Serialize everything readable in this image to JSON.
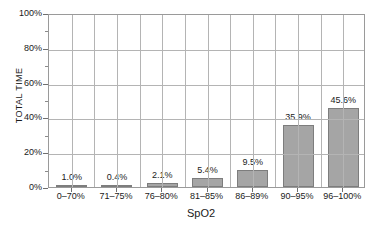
{
  "chart_data": {
    "type": "bar",
    "title": "",
    "xlabel": "SpO2",
    "ylabel": "TOTAL TIME",
    "categories": [
      "0–70%",
      "71–75%",
      "76–80%",
      "81–85%",
      "86–89%",
      "90–95%",
      "96–100%"
    ],
    "values": [
      1.0,
      0.4,
      2.1,
      5.4,
      9.5,
      35.9,
      45.6
    ],
    "value_labels": [
      "1.0%",
      "0.4%",
      "2.1%",
      "5.4%",
      "9.5%",
      "35.9%",
      "45.6%"
    ],
    "ylim": [
      0,
      100
    ],
    "ytick_labels": [
      "0%",
      "20%",
      "40%",
      "60%",
      "80%",
      "100%"
    ],
    "ytick_values": [
      0,
      20,
      40,
      60,
      80,
      100
    ],
    "grid": true,
    "legend": false,
    "colors": {
      "bar_fill": "#a5a5a5",
      "bar_border": "#7d7d7d",
      "gridline": "#b4b4b4",
      "frame": "#9a9a9a",
      "background": "#ffffff",
      "text": "#1a1a1a"
    }
  }
}
